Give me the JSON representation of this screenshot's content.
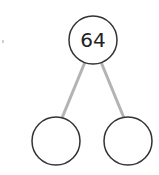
{
  "diagram": {
    "type": "part-whole-model",
    "whole": {
      "value": "64",
      "cx": 93,
      "cy": 40,
      "r": 24
    },
    "parts": [
      {
        "value": "",
        "cx": 56,
        "cy": 141,
        "r": 24
      },
      {
        "value": "",
        "cx": 128,
        "cy": 141,
        "r": 24
      }
    ],
    "colors": {
      "circle_stroke": "#333333",
      "connector": "#b3b3b3",
      "text": "#222222",
      "background": "#ffffff"
    }
  }
}
